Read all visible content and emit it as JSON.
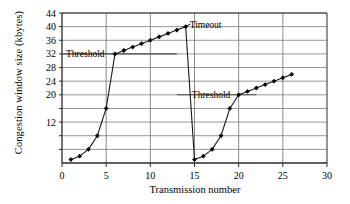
{
  "figure": {
    "title": "",
    "ylabel": "Congestion window size (kbytes)",
    "xlabel": "Transmission number"
  },
  "annotations": {
    "threshold_1": "Threshold",
    "timeout": "Timeout",
    "threshold_2": "Threshold"
  },
  "axis": {
    "y_ticks": [
      "44",
      "40",
      "36",
      "32",
      "28",
      "24",
      "20",
      "",
      "12",
      "",
      ""
    ],
    "x_ticks": [
      "0",
      "5",
      "10",
      "15",
      "20",
      "25",
      "30"
    ]
  },
  "chart_data": {
    "type": "line",
    "xlabel": "Transmission number",
    "ylabel": "Congestion window size (kbytes)",
    "xlim": [
      0,
      30
    ],
    "ylim": [
      0,
      44
    ],
    "grid": true,
    "legend": "none",
    "marker": "filled-diamond",
    "x": [
      1,
      2,
      3,
      4,
      5,
      6,
      7,
      8,
      9,
      10,
      11,
      12,
      13,
      14,
      15,
      16,
      17,
      18,
      19,
      20,
      21,
      22,
      23,
      24,
      25,
      26
    ],
    "values": [
      1,
      2,
      4,
      8,
      16,
      32,
      33,
      34,
      35,
      36,
      37,
      38,
      39,
      40,
      1,
      2,
      4,
      8,
      16,
      20,
      21,
      22,
      23,
      24,
      25,
      26
    ],
    "series": [
      {
        "name": "Congestion window",
        "values": [
          1,
          2,
          4,
          8,
          16,
          32,
          33,
          34,
          35,
          36,
          37,
          38,
          39,
          40,
          1,
          2,
          4,
          8,
          16,
          20,
          21,
          22,
          23,
          24,
          25,
          26
        ]
      }
    ],
    "annotations": [
      {
        "label": "Threshold",
        "y": 32,
        "x_from": 0,
        "x_to": 13,
        "text_x": 1.0
      },
      {
        "label": "Timeout",
        "x": 14,
        "y": 40
      },
      {
        "label": "Threshold",
        "y": 20,
        "x_from": 13,
        "x_to": 22,
        "text_x": 14.6
      }
    ],
    "y_gridlines": [
      4,
      8,
      12,
      16,
      20,
      24,
      28,
      32,
      36,
      40,
      44
    ],
    "y_ticklabels": [
      "",
      "",
      "12",
      "",
      "20",
      "24",
      "28",
      "32",
      "36",
      "40",
      "44"
    ],
    "x_ticklabels": [
      "0",
      "5",
      "10",
      "15",
      "20",
      "25",
      "30"
    ],
    "colors": {
      "line": "#1a1a1a",
      "marker": "#000000",
      "grid": "#8a8a8a",
      "axis": "#2b2b2b"
    }
  }
}
